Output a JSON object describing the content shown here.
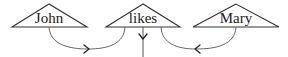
{
  "diagram": {
    "nodes": [
      {
        "id": "john",
        "label": "John"
      },
      {
        "id": "likes",
        "label": "likes"
      },
      {
        "id": "mary",
        "label": "Mary"
      }
    ],
    "edges": [
      {
        "from": "john",
        "to": "likes",
        "direction": "right"
      },
      {
        "from": "mary",
        "to": "likes",
        "direction": "left"
      },
      {
        "from": "likes",
        "to": "below",
        "direction": "down"
      }
    ],
    "colors": {
      "stroke": "#333333",
      "curve": "#666666",
      "text": "#222222"
    }
  }
}
